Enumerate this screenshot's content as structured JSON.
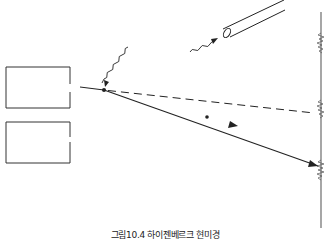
{
  "caption": "그림10.4 하이젠베르크 현미경",
  "colors": {
    "stroke": "#222222",
    "screen": "#666666",
    "background": "#ffffff"
  },
  "diagram": {
    "elements": [
      {
        "id": "upper-slit-block",
        "type": "rectangle"
      },
      {
        "id": "lower-slit-block",
        "type": "rectangle"
      },
      {
        "id": "incident-electron-path",
        "type": "line"
      },
      {
        "id": "undeflected-path",
        "type": "dashed-line"
      },
      {
        "id": "deflected-electron-path",
        "type": "arrow-line"
      },
      {
        "id": "incoming-photon",
        "type": "wavy-arrow"
      },
      {
        "id": "scattered-photon",
        "type": "wavy-arrow"
      },
      {
        "id": "microscope-tube",
        "type": "cylinder"
      },
      {
        "id": "detection-screen",
        "type": "vertical-line"
      },
      {
        "id": "interference-marks",
        "type": "zigzag",
        "count": 3
      }
    ]
  }
}
